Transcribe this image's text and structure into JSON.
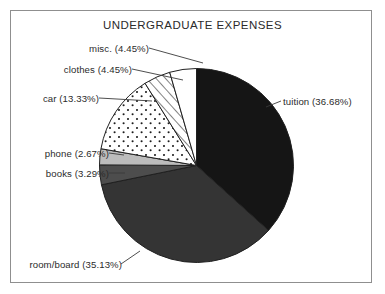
{
  "chart_data": {
    "type": "pie",
    "title": "UNDERGRADUATE EXPENSES",
    "xlabel": "",
    "ylabel": "",
    "legend_position": "none",
    "grid": false,
    "start_angle_deg": 0,
    "direction": "clockwise",
    "categories": [
      "tuition",
      "room/board",
      "books",
      "phone",
      "car",
      "clothes",
      "misc."
    ],
    "values": [
      36.68,
      35.13,
      3.29,
      2.67,
      13.33,
      4.45,
      4.45
    ],
    "slices": [
      {
        "name": "tuition",
        "label": "tuition (36.68%)",
        "value": 36.68,
        "fill": "#151515",
        "pattern": "solid",
        "label_side": "right"
      },
      {
        "name": "room/board",
        "label": "room/board (35.13%)",
        "value": 35.13,
        "fill": "#343434",
        "pattern": "solid",
        "label_side": "left"
      },
      {
        "name": "books",
        "label": "books (3.29%)",
        "value": 3.29,
        "fill": "#4d4d4d",
        "pattern": "solid",
        "label_side": "left"
      },
      {
        "name": "phone",
        "label": "phone (2.67%)",
        "value": 2.67,
        "fill": "#bcbcbc",
        "pattern": "solid",
        "label_side": "left"
      },
      {
        "name": "car",
        "label": "car (13.33%)",
        "value": 13.33,
        "fill": "#ffffff",
        "pattern": "dots",
        "label_side": "left"
      },
      {
        "name": "clothes",
        "label": "clothes (4.45%)",
        "value": 4.45,
        "fill": "#ffffff",
        "pattern": "diagonal-hatch",
        "label_side": "left"
      },
      {
        "name": "misc.",
        "label": "misc. (4.45%)",
        "value": 4.45,
        "fill": "#ffffff",
        "pattern": "none",
        "label_side": "left"
      }
    ],
    "colors": {
      "outline": "#202020",
      "leader_line": "#3a3a3a",
      "frame_border": "#8f8f8f",
      "background": "#ffffff",
      "text": "#2b2b2b"
    }
  }
}
